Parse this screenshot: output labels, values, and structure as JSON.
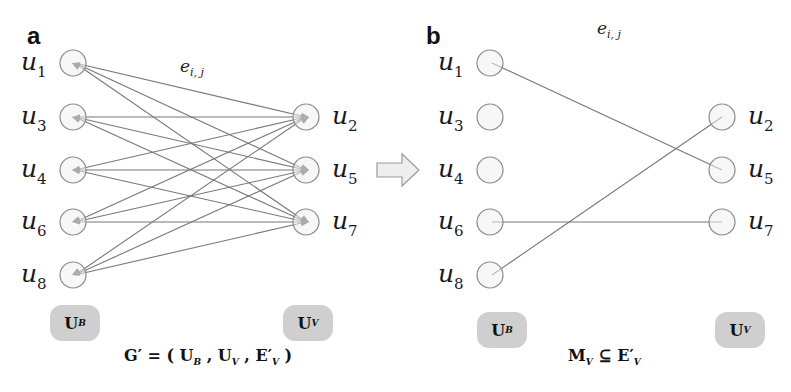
{
  "panels": {
    "a": {
      "letter": "a",
      "edge_label": {
        "base": "e",
        "sub": "i, j"
      },
      "left_nodes": [
        {
          "id": "u1",
          "base": "u",
          "sub": "1",
          "x": 73,
          "y": 63
        },
        {
          "id": "u3",
          "base": "u",
          "sub": "3",
          "x": 73,
          "y": 117
        },
        {
          "id": "u4",
          "base": "u",
          "sub": "4",
          "x": 73,
          "y": 170
        },
        {
          "id": "u6",
          "base": "u",
          "sub": "6",
          "x": 73,
          "y": 222
        },
        {
          "id": "u8",
          "base": "u",
          "sub": "8",
          "x": 73,
          "y": 275
        }
      ],
      "right_nodes": [
        {
          "id": "u2",
          "base": "u",
          "sub": "2",
          "x": 306,
          "y": 117
        },
        {
          "id": "u5",
          "base": "u",
          "sub": "5",
          "x": 306,
          "y": 170
        },
        {
          "id": "u7",
          "base": "u",
          "sub": "7",
          "x": 306,
          "y": 222
        }
      ],
      "edges": [
        [
          "u1",
          "u2"
        ],
        [
          "u1",
          "u5"
        ],
        [
          "u1",
          "u7"
        ],
        [
          "u3",
          "u2"
        ],
        [
          "u3",
          "u5"
        ],
        [
          "u3",
          "u7"
        ],
        [
          "u4",
          "u2"
        ],
        [
          "u4",
          "u5"
        ],
        [
          "u4",
          "u7"
        ],
        [
          "u6",
          "u2"
        ],
        [
          "u6",
          "u5"
        ],
        [
          "u6",
          "u7"
        ],
        [
          "u8",
          "u2"
        ],
        [
          "u8",
          "u5"
        ],
        [
          "u8",
          "u7"
        ]
      ],
      "set_left": {
        "base": "U",
        "sub": "B"
      },
      "set_right": {
        "base": "U",
        "sub": "V"
      },
      "formula": "G′ = ( U_B , U_V , E′_V )"
    },
    "b": {
      "letter": "b",
      "edge_label": {
        "base": "e",
        "sub": "i, j"
      },
      "left_nodes": [
        {
          "id": "u1",
          "base": "u",
          "sub": "1",
          "x": 490,
          "y": 63
        },
        {
          "id": "u3",
          "base": "u",
          "sub": "3",
          "x": 490,
          "y": 117
        },
        {
          "id": "u4",
          "base": "u",
          "sub": "4",
          "x": 490,
          "y": 170
        },
        {
          "id": "u6",
          "base": "u",
          "sub": "6",
          "x": 490,
          "y": 222
        },
        {
          "id": "u8",
          "base": "u",
          "sub": "8",
          "x": 490,
          "y": 275
        }
      ],
      "right_nodes": [
        {
          "id": "u2",
          "base": "u",
          "sub": "2",
          "x": 722,
          "y": 117
        },
        {
          "id": "u5",
          "base": "u",
          "sub": "5",
          "x": 722,
          "y": 170
        },
        {
          "id": "u7",
          "base": "u",
          "sub": "7",
          "x": 722,
          "y": 222
        }
      ],
      "edges": [
        [
          "u1",
          "u5"
        ],
        [
          "u8",
          "u2"
        ],
        [
          "u6",
          "u7"
        ]
      ],
      "set_left": {
        "base": "U",
        "sub": "B"
      },
      "set_right": {
        "base": "U",
        "sub": "V"
      },
      "formula": "M_V ⊆ E′_V"
    }
  },
  "transition_arrow": {
    "direction": "right",
    "fill": "#eeeeee",
    "stroke": "#9a9a9a"
  },
  "colors": {
    "node_fill": "#f0f0f0",
    "node_stroke": "#8a8a8a",
    "edge": "#777777",
    "badge": "#cfcfcf"
  }
}
